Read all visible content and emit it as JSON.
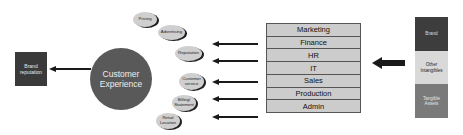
{
  "diagram": {
    "brand_reputation": {
      "label": "Brand reputation"
    },
    "customer_experience": {
      "label": "Customer Experience"
    },
    "touchpoints": [
      {
        "label": "Pricing"
      },
      {
        "label": "Advertising"
      },
      {
        "label": "Reputation"
      },
      {
        "label": "Customer service"
      },
      {
        "label": "Billing/ Statement"
      },
      {
        "label": "Retail Location"
      }
    ],
    "departments": [
      {
        "label": "Marketing"
      },
      {
        "label": "Finance"
      },
      {
        "label": "HR"
      },
      {
        "label": "IT"
      },
      {
        "label": "Sales"
      },
      {
        "label": "Production"
      },
      {
        "label": "Admin"
      }
    ],
    "assets": [
      {
        "label": "Brand",
        "color": "#3d3d3d",
        "text_color": "#dddddd"
      },
      {
        "label": "Other Intangibles",
        "color": "#d9d9d9",
        "text_color": "#222222"
      },
      {
        "label": "Tangible Assets",
        "color": "#7a7a7a",
        "text_color": "#e4e4e4"
      }
    ]
  }
}
